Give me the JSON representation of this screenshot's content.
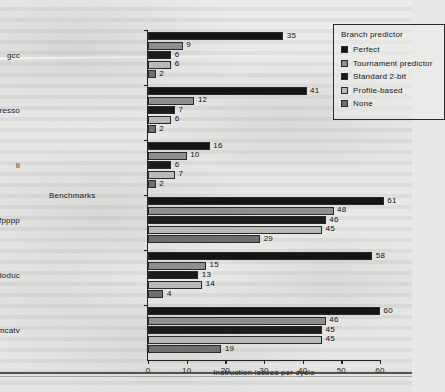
{
  "chart_data": {
    "type": "bar",
    "orientation": "horizontal",
    "title": "",
    "xlabel": "Instruction issues per cycle",
    "ylabel": "Benchmarks",
    "xlim": [
      0,
      60
    ],
    "xticks": [
      0,
      10,
      20,
      30,
      40,
      50,
      60
    ],
    "grid": false,
    "legend_position": "top-right",
    "legend_title": "Branch predictor",
    "categories": [
      "gcc",
      "espresso",
      "li",
      "fpppp",
      "doduc",
      "tomcatv"
    ],
    "series": [
      {
        "name": "Perfect",
        "color": "#141414",
        "values": [
          35,
          41,
          16,
          61,
          58,
          60
        ]
      },
      {
        "name": "Tournament predictor",
        "color": "#8e8e8e",
        "values": [
          9,
          12,
          10,
          48,
          15,
          46
        ]
      },
      {
        "name": "Standard 2-bit",
        "color": "#1b1b1b",
        "values": [
          6,
          7,
          6,
          46,
          13,
          45
        ]
      },
      {
        "name": "Profile-based",
        "color": "#b9b9b9",
        "values": [
          6,
          6,
          7,
          45,
          14,
          45
        ]
      },
      {
        "name": "None",
        "color": "#6f6f6f",
        "values": [
          2,
          2,
          2,
          29,
          4,
          19
        ]
      }
    ]
  },
  "axis": {
    "x_title": "Instruction issues per cycle",
    "y_title": "Benchmarks",
    "x_tick_labels": [
      "0",
      "10",
      "20",
      "30",
      "40",
      "50",
      "60"
    ]
  },
  "legend": {
    "title": "Branch predictor",
    "items": [
      {
        "label": "Perfect"
      },
      {
        "label": "Tournament predictor"
      },
      {
        "label": "Standard 2-bit"
      },
      {
        "label": "Profile-based"
      },
      {
        "label": "None"
      }
    ]
  }
}
